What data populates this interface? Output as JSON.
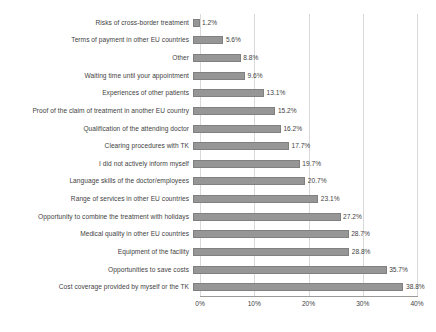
{
  "chart_data": {
    "type": "bar",
    "orientation": "horizontal",
    "title": "",
    "xlabel": "",
    "ylabel": "",
    "xlim": [
      0,
      40
    ],
    "grid": true,
    "legend": false,
    "tick_labels": [
      "0%",
      "10%",
      "20%",
      "30%",
      "40%"
    ],
    "tick_values": [
      0,
      10,
      20,
      30,
      40
    ],
    "value_suffix": "%",
    "bar_color": "#969696",
    "bar_edge_color": "#808080",
    "gridline_color": "#d9d9d9",
    "axis_color": "#9a9a9a",
    "categories": [
      "Risks of cross-border treatment",
      "Terms of payment in other EU countries",
      "Other",
      "Waiting time until your appointment",
      "Experiences of other patients",
      "Proof of the claim of treatment in another EU country",
      "Qualification of the attending doctor",
      "Clearing procedures with TK",
      "I did not actively inform myself",
      "Language skills of the doctor/employees",
      "Range of services in other EU countries",
      "Opportunity to combine the treatment with holidays",
      "Medical quality in other EU countries",
      "Equipment of the facility",
      "Opportunities to save costs",
      "Cost coverage provided by myself or the TK"
    ],
    "values": [
      1.2,
      5.6,
      8.8,
      9.6,
      13.1,
      15.2,
      16.2,
      17.7,
      19.7,
      20.7,
      23.1,
      27.2,
      28.7,
      28.8,
      35.7,
      38.8
    ],
    "value_labels": [
      "1.2%",
      "5.6%",
      "8.8%",
      "9.6%",
      "13.1%",
      "15.2%",
      "16.2%",
      "17.7%",
      "19.7%",
      "20.7%",
      "23.1%",
      "27.2%",
      "28.7%",
      "28.8%",
      "35.7%",
      "38.8%"
    ]
  }
}
